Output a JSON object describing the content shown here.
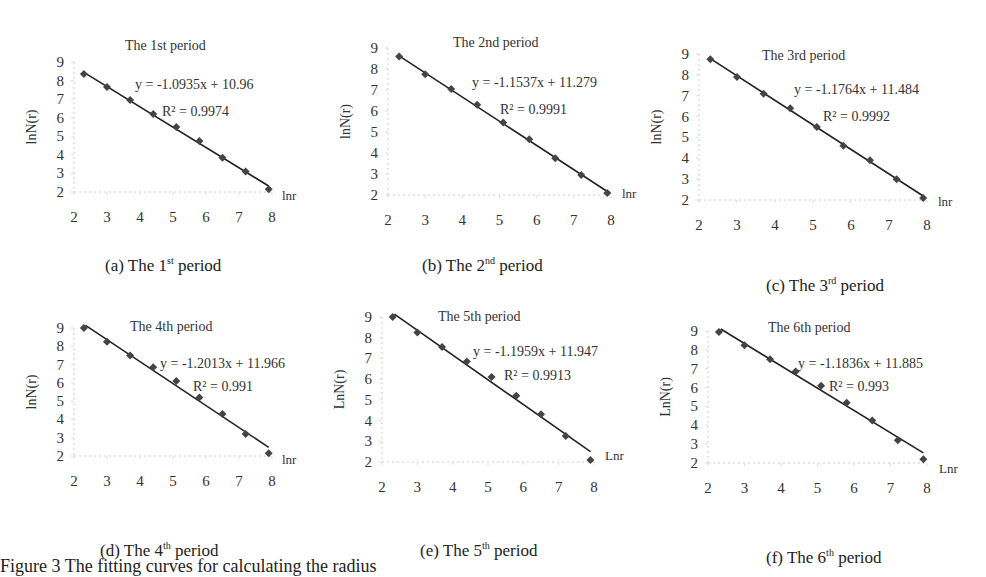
{
  "figure_caption": "Figure 3    The fitting curves for calculating the radius",
  "chart_data": [
    {
      "id": "a",
      "type": "scatter",
      "title": "The 1st period",
      "caption_prefix": "(a) The 1",
      "caption_sup": "st",
      "caption_suffix": " period",
      "xlabel": "lnr",
      "ylabel": "lnN(r)",
      "xlim": [
        2,
        8
      ],
      "ylim": [
        2,
        9
      ],
      "xticks": [
        2,
        3,
        4,
        5,
        6,
        7,
        8
      ],
      "yticks": [
        2,
        3,
        4,
        5,
        6,
        7,
        8,
        9
      ],
      "x": [
        2.3,
        3.0,
        3.7,
        4.4,
        5.1,
        5.8,
        6.5,
        7.2,
        7.9
      ],
      "y": [
        8.35,
        7.65,
        6.95,
        6.2,
        5.5,
        4.75,
        3.85,
        3.1,
        2.15
      ],
      "trendline": {
        "slope": -1.0935,
        "intercept": 10.96,
        "equation": "y = -1.0935x + 10.96",
        "r2": "R² = 0.9974"
      },
      "box": {
        "left": 0,
        "top": 0,
        "width": 330,
        "height": 290
      },
      "plot": {
        "x0": 74,
        "x1": 272,
        "y0": 62,
        "y1": 192
      },
      "title_pos": [
        125,
        50
      ],
      "eq_pos": [
        135,
        89
      ],
      "r2_pos": [
        162,
        116
      ],
      "xlabel_pos": [
        282,
        200
      ],
      "caption_pos": [
        105,
        255
      ]
    },
    {
      "id": "b",
      "type": "scatter",
      "title": "The 2nd period",
      "caption_prefix": "(b) The 2",
      "caption_sup": "nd",
      "caption_suffix": " period",
      "xlabel": "lnr",
      "ylabel": "lnN(r)",
      "xlim": [
        2,
        8
      ],
      "ylim": [
        2,
        9
      ],
      "xticks": [
        2,
        3,
        4,
        5,
        6,
        7,
        8
      ],
      "yticks": [
        2,
        3,
        4,
        5,
        6,
        7,
        8,
        9
      ],
      "x": [
        2.3,
        3.0,
        3.7,
        4.4,
        5.1,
        5.8,
        6.5,
        7.2,
        7.9
      ],
      "y": [
        8.6,
        7.75,
        7.05,
        6.3,
        5.45,
        4.65,
        3.75,
        2.95,
        2.1
      ],
      "trendline": {
        "slope": -1.1537,
        "intercept": 11.279,
        "equation": "y = -1.1537x + 11.279",
        "r2": "R² = 0.9991"
      },
      "box": {
        "left": 330,
        "top": 0,
        "width": 330,
        "height": 290
      },
      "plot": {
        "x0": 58,
        "x1": 281,
        "y0": 48,
        "y1": 195
      },
      "title_pos": [
        123,
        47
      ],
      "eq_pos": [
        142,
        87
      ],
      "r2_pos": [
        170,
        114
      ],
      "xlabel_pos": [
        292,
        198
      ],
      "caption_pos": [
        92,
        255
      ]
    },
    {
      "id": "c",
      "type": "scatter",
      "title": "The 3rd period",
      "caption_prefix": "(c) The 3",
      "caption_sup": "rd",
      "caption_suffix": " period",
      "xlabel": "lnr",
      "ylabel": "lnN(r)",
      "xlim": [
        2,
        8
      ],
      "ylim": [
        2,
        9
      ],
      "xticks": [
        2,
        3,
        4,
        5,
        6,
        7,
        8
      ],
      "yticks": [
        2,
        3,
        4,
        5,
        6,
        7,
        8,
        9
      ],
      "x": [
        2.3,
        3.0,
        3.7,
        4.4,
        5.1,
        5.8,
        6.5,
        7.2,
        7.9
      ],
      "y": [
        8.75,
        7.9,
        7.1,
        6.4,
        5.5,
        4.6,
        3.9,
        3.0,
        2.1
      ],
      "trendline": {
        "slope": -1.1764,
        "intercept": 11.484,
        "equation": "y = -1.1764x + 11.484",
        "r2": "R² = 0.9992"
      },
      "box": {
        "left": 656,
        "top": 0,
        "width": 330,
        "height": 290
      },
      "plot": {
        "x0": 43,
        "x1": 271,
        "y0": 54,
        "y1": 200
      },
      "title_pos": [
        106,
        60
      ],
      "eq_pos": [
        138,
        94
      ],
      "r2_pos": [
        167,
        121
      ],
      "xlabel_pos": [
        282,
        206
      ],
      "caption_pos": [
        110,
        275
      ]
    },
    {
      "id": "d",
      "type": "scatter",
      "title": "The 4th period",
      "caption_prefix": "(d) The 4",
      "caption_sup": "th",
      "caption_suffix": " period",
      "xlabel": "lnr",
      "ylabel": "lnN(r)",
      "xlim": [
        2,
        8
      ],
      "ylim": [
        2,
        9
      ],
      "xticks": [
        2,
        3,
        4,
        5,
        6,
        7,
        8
      ],
      "yticks": [
        2,
        3,
        4,
        5,
        6,
        7,
        8,
        9
      ],
      "x": [
        2.3,
        3.0,
        3.7,
        4.4,
        5.1,
        5.8,
        6.5,
        7.2,
        7.9
      ],
      "y": [
        9.0,
        8.25,
        7.5,
        6.85,
        6.1,
        5.2,
        4.3,
        3.2,
        2.15
      ],
      "trendline": {
        "slope": -1.2013,
        "intercept": 11.966,
        "equation": "y = -1.2013x + 11.966",
        "r2": "R² = 0.991"
      },
      "box": {
        "left": 0,
        "top": 290,
        "width": 330,
        "height": 284
      },
      "plot": {
        "x0": 74,
        "x1": 272,
        "y0": 38,
        "y1": 166
      },
      "title_pos": [
        130,
        41
      ],
      "eq_pos": [
        160,
        78
      ],
      "r2_pos": [
        193,
        101
      ],
      "xlabel_pos": [
        282,
        174
      ],
      "caption_pos": [
        100,
        250
      ]
    },
    {
      "id": "e",
      "type": "scatter",
      "title": "The 5th period",
      "caption_prefix": "(e) The 5",
      "caption_sup": "th",
      "caption_suffix": " period",
      "xlabel": "Lnr",
      "ylabel": "LnN(r)",
      "xlim": [
        2,
        8
      ],
      "ylim": [
        2,
        9
      ],
      "xticks": [
        2,
        3,
        4,
        5,
        6,
        7,
        8
      ],
      "yticks": [
        2,
        3,
        4,
        5,
        6,
        7,
        8,
        9
      ],
      "x": [
        2.3,
        3.0,
        3.7,
        4.4,
        5.1,
        5.8,
        6.5,
        7.2,
        7.9
      ],
      "y": [
        9.0,
        8.25,
        7.55,
        6.85,
        6.1,
        5.2,
        4.3,
        3.25,
        2.1
      ],
      "trendline": {
        "slope": -1.1959,
        "intercept": 11.947,
        "equation": "y = -1.1959x + 11.947",
        "r2": "R² = 0.9913"
      },
      "box": {
        "left": 330,
        "top": 290,
        "width": 330,
        "height": 284
      },
      "plot": {
        "x0": 52,
        "x1": 264,
        "y0": 27,
        "y1": 172
      },
      "title_pos": [
        108,
        31
      ],
      "eq_pos": [
        143,
        66
      ],
      "r2_pos": [
        174,
        90
      ],
      "xlabel_pos": [
        275,
        170
      ],
      "caption_pos": [
        90,
        250
      ]
    },
    {
      "id": "f",
      "type": "scatter",
      "title": "The 6th period",
      "caption_prefix": "(f) The 6",
      "caption_sup": "th",
      "caption_suffix": " period",
      "xlabel": "Lnr",
      "ylabel": "LnN(r)",
      "xlim": [
        2,
        8
      ],
      "ylim": [
        2,
        9
      ],
      "xticks": [
        2,
        3,
        4,
        5,
        6,
        7,
        8
      ],
      "yticks": [
        2,
        3,
        4,
        5,
        6,
        7,
        8,
        9
      ],
      "x": [
        2.3,
        3.0,
        3.7,
        4.4,
        5.1,
        5.8,
        6.5,
        7.2,
        7.9
      ],
      "y": [
        8.95,
        8.25,
        7.5,
        6.85,
        6.1,
        5.2,
        4.25,
        3.2,
        2.2
      ],
      "trendline": {
        "slope": -1.1836,
        "intercept": 11.885,
        "equation": "y = -1.1836x + 11.885",
        "r2": "R² = 0.993"
      },
      "box": {
        "left": 656,
        "top": 290,
        "width": 330,
        "height": 284
      },
      "plot": {
        "x0": 52,
        "x1": 271,
        "y0": 41,
        "y1": 173
      },
      "title_pos": [
        112,
        42
      ],
      "eq_pos": [
        142,
        78
      ],
      "r2_pos": [
        173,
        101
      ],
      "xlabel_pos": [
        283,
        183
      ],
      "caption_pos": [
        110,
        257
      ]
    }
  ]
}
